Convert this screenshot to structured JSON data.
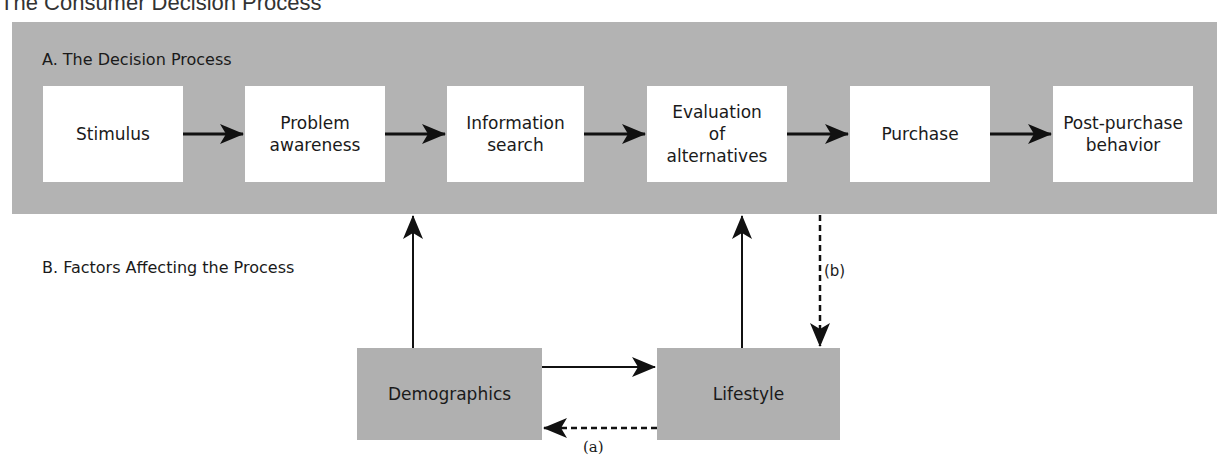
{
  "title": "The Consumer Decision Process",
  "section_a": {
    "label": "A. The Decision Process"
  },
  "section_b": {
    "label": "B. Factors Affecting the Process"
  },
  "steps": [
    {
      "label": "Stimulus"
    },
    {
      "label": "Problem\nawareness"
    },
    {
      "label": "Information\nsearch"
    },
    {
      "label": "Evaluation\nof\nalternatives"
    },
    {
      "label": "Purchase"
    },
    {
      "label": "Post-purchase\nbehavior"
    }
  ],
  "factors": [
    {
      "label": "Demographics"
    },
    {
      "label": "Lifestyle"
    }
  ],
  "annotations": {
    "a": "(a)",
    "b": "(b)"
  },
  "colors": {
    "panel": "#b3b3b3",
    "factor_box": "#b0b0b0",
    "step_box": "#ffffff",
    "arrow": "#111111"
  }
}
